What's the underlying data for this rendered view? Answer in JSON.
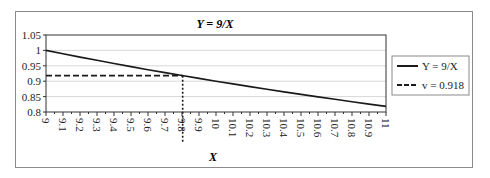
{
  "chart_data": {
    "type": "line",
    "title": "Y = 9/X",
    "xlabel": "X",
    "ylabel": "",
    "x": [
      9,
      9.1,
      9.2,
      9.3,
      9.4,
      9.5,
      9.6,
      9.7,
      9.8,
      9.9,
      10,
      10.1,
      10.2,
      10.3,
      10.4,
      10.5,
      10.6,
      10.7,
      10.8,
      10.9,
      11
    ],
    "x_tick_labels": [
      "9",
      "9.1",
      "9.2",
      "9.3",
      "9.4",
      "9.5",
      "9.6",
      "9.7",
      "9.8",
      "9.9",
      "10",
      "10.1",
      "10.2",
      "10.3",
      "10.4",
      "10.5",
      "10.6",
      "10.7",
      "10.8",
      "10.9",
      "11"
    ],
    "y_tick_labels": [
      "1.05",
      "1",
      "0.95",
      "0.9",
      "0.85",
      "0.8"
    ],
    "ylim": [
      0.8,
      1.05
    ],
    "xlim": [
      9,
      11
    ],
    "grid": true,
    "legend_position": "right",
    "series": [
      {
        "name": "Y = 9/X",
        "style": "solid",
        "values": [
          1.0,
          0.989,
          0.978,
          0.968,
          0.957,
          0.947,
          0.9375,
          0.928,
          0.918,
          0.909,
          0.9,
          0.891,
          0.882,
          0.874,
          0.865,
          0.857,
          0.849,
          0.841,
          0.833,
          0.826,
          0.818
        ]
      },
      {
        "name": "v = 0.918",
        "style": "dashed",
        "from_x": 9,
        "to_x": 9.804,
        "value": 0.918
      }
    ],
    "annotations": [
      {
        "type": "vertical-dotted-line",
        "x": 9.804,
        "from_y": 0.918,
        "extends_below_axis": true
      }
    ]
  },
  "legend": {
    "items": [
      {
        "label": "Y = 9/X",
        "style": "solid"
      },
      {
        "label": "v = 0.918",
        "style": "dashed"
      }
    ]
  },
  "colors": {
    "line": "#1a1a1a",
    "grid": "#d8d8d8",
    "frame": "#8a8a8a"
  }
}
